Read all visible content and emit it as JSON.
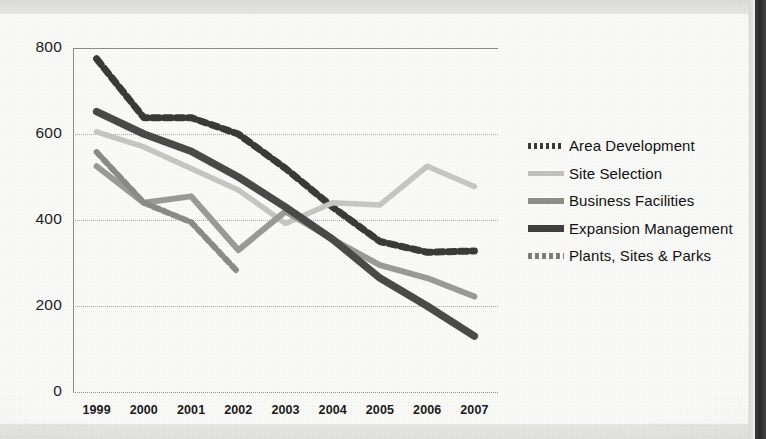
{
  "chart_data": {
    "type": "line",
    "title": "",
    "xlabel": "",
    "ylabel": "",
    "x": [
      "1999",
      "2000",
      "2001",
      "2002",
      "2003",
      "2004",
      "2005",
      "2006",
      "2007"
    ],
    "categories": [
      "1999",
      "2000",
      "2001",
      "2002",
      "2003",
      "2004",
      "2005",
      "2006",
      "2007"
    ],
    "ylim": [
      0,
      800
    ],
    "yticks": [
      0,
      200,
      400,
      600,
      800
    ],
    "grid": true,
    "legend_position": "right",
    "series": [
      {
        "name": "Area Development",
        "style": "dashed",
        "color": "#3a3a3a",
        "values": [
          775,
          638,
          638,
          600,
          520,
          430,
          350,
          325,
          328
        ]
      },
      {
        "name": "Site Selection",
        "style": "solid",
        "color": "#c6c6c2",
        "values": [
          605,
          570,
          520,
          470,
          392,
          440,
          435,
          525,
          478
        ]
      },
      {
        "name": "Business Facilities",
        "style": "solid",
        "color": "#9a9a97",
        "values": [
          525,
          440,
          455,
          330,
          420,
          355,
          295,
          265,
          222
        ]
      },
      {
        "name": "Expansion Management",
        "style": "solid",
        "color": "#4a4a4a",
        "values": [
          652,
          600,
          560,
          500,
          430,
          355,
          265,
          200,
          130
        ]
      },
      {
        "name": "Plants, Sites & Parks",
        "style": "dashed",
        "color": "#8b8b88",
        "values": [
          558,
          440,
          395,
          278,
          null,
          null,
          null,
          null,
          null
        ]
      }
    ]
  },
  "axis": {
    "ytick_labels": [
      "800",
      "600",
      "400",
      "200",
      "0"
    ],
    "xtick_labels": [
      "1999",
      "2000",
      "2001",
      "2002",
      "2003",
      "2004",
      "2005",
      "2006",
      "2007"
    ]
  },
  "legend": {
    "items": [
      {
        "label": "Area Development",
        "icon": "dashed-line-swatch",
        "color": "#3a3a3a"
      },
      {
        "label": "Site Selection",
        "icon": "solid-line-swatch",
        "color": "#c2c2be"
      },
      {
        "label": "Business Facilities",
        "icon": "solid-line-swatch",
        "color": "#8f8f8c"
      },
      {
        "label": "Expansion Management",
        "icon": "solid-line-swatch",
        "color": "#3f3f3f"
      },
      {
        "label": "Plants, Sites & Parks",
        "icon": "dashed-line-swatch",
        "color": "#7e7e7b"
      }
    ]
  }
}
